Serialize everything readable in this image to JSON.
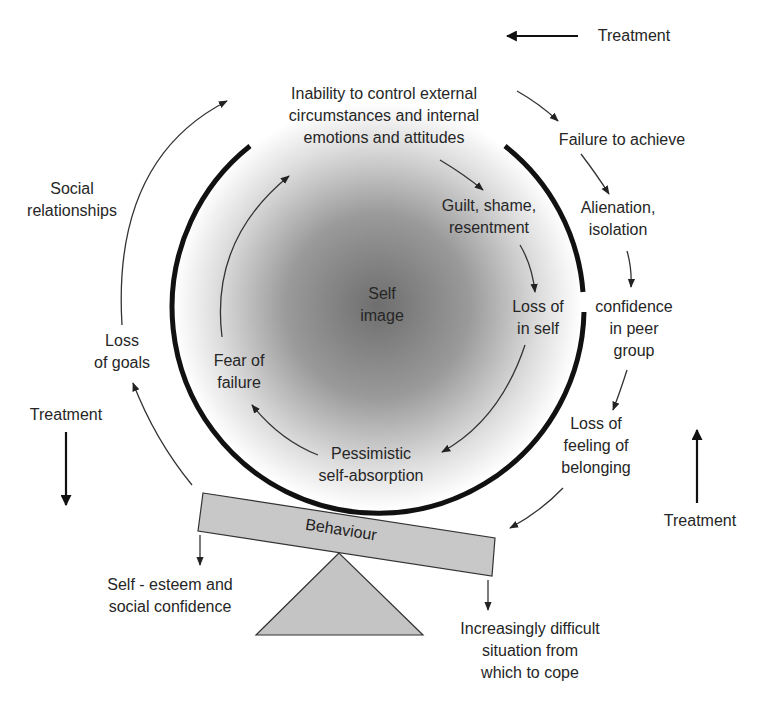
{
  "diagram": {
    "center_label": [
      "Self",
      "image"
    ],
    "inner_cycle": [
      {
        "id": "inability",
        "lines": [
          "Inability to control external",
          "circumstances and internal",
          "emotions and attitudes"
        ]
      },
      {
        "id": "guilt",
        "lines": [
          "Guilt, shame,",
          "resentment"
        ]
      },
      {
        "id": "loss-self",
        "lines": [
          "Loss of",
          "in self"
        ]
      },
      {
        "id": "pessimistic",
        "lines": [
          "Pessimistic",
          "self-absorption"
        ]
      },
      {
        "id": "fear",
        "lines": [
          "Fear of",
          "failure"
        ]
      }
    ],
    "outer_cycle": [
      {
        "id": "failure",
        "lines": [
          "Failure to achieve"
        ]
      },
      {
        "id": "alienation",
        "lines": [
          "Alienation,",
          "isolation"
        ]
      },
      {
        "id": "confidence-peer",
        "lines": [
          "confidence",
          "in peer",
          "group"
        ]
      },
      {
        "id": "loss-belonging",
        "lines": [
          "Loss of",
          "feeling of",
          "belonging"
        ]
      },
      {
        "id": "loss-goals",
        "lines": [
          "Loss",
          "of goals"
        ]
      },
      {
        "id": "social",
        "lines": [
          "Social",
          "relationships"
        ]
      }
    ],
    "balance": {
      "beam_label": "Behaviour",
      "left_outcome": [
        "Self - esteem and",
        "social confidence"
      ],
      "right_outcome": [
        "Increasingly difficult",
        "situation from",
        "which to cope"
      ]
    },
    "treatment_arrows": [
      {
        "id": "top",
        "label": "Treatment",
        "direction": "left"
      },
      {
        "id": "left",
        "label": "Treatment",
        "direction": "down"
      },
      {
        "id": "right",
        "label": "Treatment",
        "direction": "up"
      }
    ],
    "colors": {
      "circle_stroke": "#111111",
      "gradient_center": "#6e6e6e",
      "gradient_edge": "#ffffff",
      "beam_fill": "#c8c8c8",
      "fulcrum_fill": "#c4c4c4"
    }
  }
}
